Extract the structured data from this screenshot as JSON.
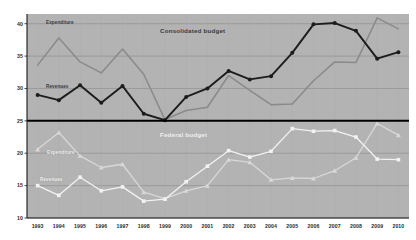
{
  "chart_data": {
    "type": "line",
    "title": "",
    "xlabel": "",
    "ylabel": "",
    "x": [
      1993,
      1994,
      1995,
      1996,
      1997,
      1998,
      1999,
      2000,
      2001,
      2002,
      2003,
      2004,
      2005,
      2006,
      2007,
      2008,
      2009,
      2010
    ],
    "xticklabels": [
      "1993",
      "1994",
      "1995",
      "1996",
      "1997",
      "1998",
      "1999",
      "2000",
      "2001",
      "2002",
      "2003",
      "2004",
      "2005",
      "2006",
      "2007",
      "2008",
      "2009",
      "2010"
    ],
    "yticklabels": [
      "40",
      "35",
      "30",
      "25",
      "20",
      "15",
      "10"
    ],
    "yticks": [
      40,
      35,
      30,
      25,
      20,
      15,
      10
    ],
    "ylim": [
      10,
      41.5
    ],
    "grid": true,
    "legend_position": "inline-annotations",
    "panels": [
      {
        "name": "consolidated",
        "title": "Consolidated budget",
        "title_color": "#3a3a3a",
        "series": [
          {
            "name": "Expenditure",
            "label": "Expenditure",
            "color": "#8a8a8a",
            "marker": "none",
            "values": [
              33.6,
              37.8,
              34.1,
              32.4,
              36.1,
              32.2,
              25.2,
              26.6,
              27.1,
              32.0,
              29.7,
              27.5,
              27.6,
              31.2,
              34.1,
              34.0,
              40.9,
              39.2
            ]
          },
          {
            "name": "Revenues",
            "label": "Revenues",
            "color": "#1c1c1c",
            "marker": "circle",
            "values": [
              29.0,
              28.2,
              30.5,
              27.8,
              30.4,
              26.1,
              25.1,
              28.7,
              30.0,
              32.7,
              31.4,
              31.9,
              35.5,
              39.9,
              40.1,
              38.9,
              34.6,
              35.6
            ]
          }
        ]
      },
      {
        "name": "federal",
        "title": "Federal budget",
        "title_color": "#efefef",
        "series": [
          {
            "name": "Expenditure",
            "label": "Expenditure",
            "color": "#d8d8d8",
            "marker": "triangle",
            "values": [
              20.6,
              23.2,
              19.6,
              17.8,
              18.3,
              14.0,
              13.0,
              14.2,
              15.0,
              19.0,
              18.6,
              15.9,
              16.2,
              16.1,
              17.3,
              19.3,
              24.6,
              22.8
            ]
          },
          {
            "name": "Revenues",
            "label": "Revenues",
            "color": "#f2f2f2",
            "marker": "square",
            "values": [
              15.0,
              13.5,
              16.3,
              14.2,
              14.8,
              12.6,
              12.9,
              15.6,
              18.0,
              20.4,
              19.4,
              20.3,
              23.8,
              23.4,
              23.5,
              22.5,
              19.1,
              19.0
            ]
          }
        ]
      }
    ],
    "divider_value": 25,
    "colors": {
      "plot_background": "#b0b0b0",
      "grid": "#8f8f8f",
      "axis": "#1a1a1a",
      "divider": "#000000"
    }
  }
}
